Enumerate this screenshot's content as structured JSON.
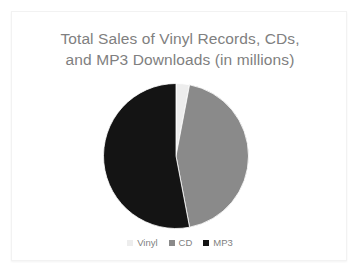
{
  "slide": {
    "background_color": "#ffffff",
    "border_color": "#f2f2f2"
  },
  "chart_data": {
    "type": "pie",
    "title": "Total Sales of Vinyl Records, CDs, and MP3 Downloads (in millions)",
    "title_lines": [
      "Total Sales of Vinyl Records, CDs,",
      "and MP3 Downloads (in millions)"
    ],
    "title_color": "#808080",
    "categories": [
      "Vinyl",
      "CD",
      "MP3"
    ],
    "values": [
      3,
      44,
      53
    ],
    "unit": "millions",
    "colors": [
      "#ededed",
      "#8a8a8a",
      "#141414"
    ],
    "legend_position": "bottom",
    "grid": false,
    "xlabel": "",
    "ylabel": "",
    "slices": [
      {
        "label": "Vinyl",
        "value": 3,
        "color": "#ededed",
        "start_angle": 0,
        "end_angle": 10.8
      },
      {
        "label": "CD",
        "value": 44,
        "color": "#8a8a8a",
        "start_angle": 10.8,
        "end_angle": 169.2
      },
      {
        "label": "MP3",
        "value": 53,
        "color": "#141414",
        "start_angle": 169.2,
        "end_angle": 360
      }
    ]
  },
  "legend": {
    "items": [
      {
        "label": "Vinyl",
        "color": "#ededed",
        "marker": "square-marker"
      },
      {
        "label": "CD",
        "color": "#8a8a8a",
        "marker": "square-marker"
      },
      {
        "label": "MP3",
        "color": "#141414",
        "marker": "square-marker"
      }
    ],
    "text_color": "#7f7f7f"
  }
}
